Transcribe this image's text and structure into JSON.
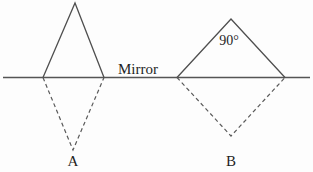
{
  "diagram": {
    "mirror_label": "Mirror",
    "angle_label": "90°",
    "object_a_label": "A",
    "object_b_label": "B",
    "colors": {
      "line": "#4f4f4f",
      "dashed_line": "#5a5a5a",
      "text": "#1f1f1f",
      "background": "#fdfdfd"
    }
  }
}
